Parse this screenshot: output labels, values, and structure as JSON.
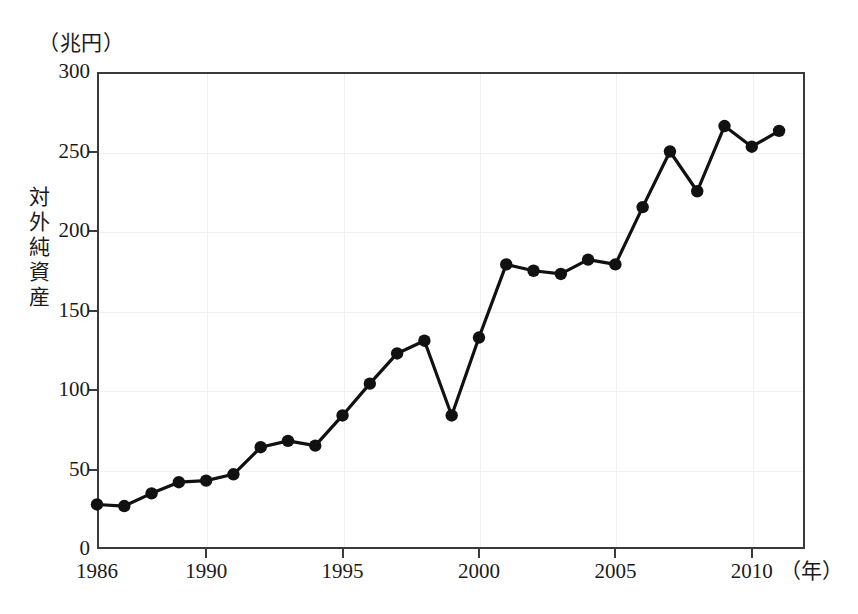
{
  "chart_data": {
    "type": "line",
    "title": "",
    "unit_label": "（兆円）",
    "ylabel": "対外純資産",
    "xlabel": "（年）",
    "x": [
      1986,
      1987,
      1988,
      1989,
      1990,
      1991,
      1992,
      1993,
      1994,
      1995,
      1996,
      1997,
      1998,
      1999,
      2000,
      2001,
      2002,
      2003,
      2004,
      2005,
      2006,
      2007,
      2008,
      2009,
      2010,
      2011
    ],
    "values": [
      28,
      27,
      35,
      42,
      43,
      47,
      64,
      68,
      65,
      84,
      104,
      123,
      131,
      84,
      133,
      179,
      175,
      173,
      182,
      179,
      215,
      250,
      225,
      266,
      253,
      263
    ],
    "series": [
      {
        "name": "対外純資産",
        "values": [
          28,
          27,
          35,
          42,
          43,
          47,
          64,
          68,
          65,
          84,
          104,
          123,
          131,
          84,
          133,
          179,
          175,
          173,
          182,
          179,
          215,
          250,
          225,
          266,
          253,
          263
        ]
      }
    ],
    "xlim": [
      1986,
      2011.95
    ],
    "ylim": [
      0,
      300
    ],
    "ytick_labels": [
      "0",
      "50",
      "100",
      "150",
      "200",
      "250",
      "300"
    ],
    "ytick_values": [
      0,
      50,
      100,
      150,
      200,
      250,
      300
    ],
    "xtick_labels": [
      "1986",
      "1990",
      "1995",
      "2000",
      "2005",
      "2010"
    ],
    "xtick_values": [
      1986,
      1990,
      1995,
      2000,
      2005,
      2010
    ],
    "grid": true,
    "legend": "none",
    "marker": "filled-circle",
    "line_color": "#111111",
    "marker_color": "#111111",
    "grid_color": "#f0f0f0",
    "axis_color": "#3a3a3a"
  }
}
